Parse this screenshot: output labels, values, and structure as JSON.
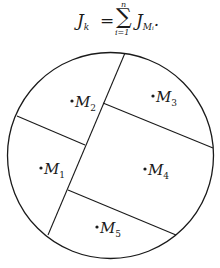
{
  "formula": {
    "lhs": "J",
    "lhs_sub": "k",
    "equals": "=",
    "sum_symbol": "∑",
    "upper_limit": "n",
    "lower_limit": "i=1",
    "rhs": "J",
    "rhs_sub": "Mᵢ",
    "trailing": "."
  },
  "diagram": {
    "circle": {
      "cx": 110.5,
      "cy": 155.5,
      "r": 103
    },
    "stroke_color": "#1a1a1a",
    "regions": [
      {
        "id": "M1",
        "letter": "M",
        "index": "1",
        "dot": [
          41,
          169
        ]
      },
      {
        "id": "M2",
        "letter": "M",
        "index": "2",
        "dot": [
          72,
          102
        ]
      },
      {
        "id": "M3",
        "letter": "M",
        "index": "3",
        "dot": [
          153,
          96
        ]
      },
      {
        "id": "M4",
        "letter": "M",
        "index": "4",
        "dot": [
          145,
          170
        ]
      },
      {
        "id": "M5",
        "letter": "M",
        "index": "5",
        "dot": [
          97,
          228
        ]
      }
    ]
  }
}
